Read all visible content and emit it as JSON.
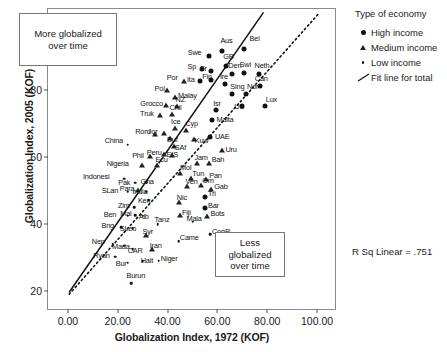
{
  "chart_data": {
    "type": "scatter",
    "title": "",
    "xlabel": "Globalization Index, 1972 (KOF)",
    "ylabel": "Globalization Index, 2005 (KOF)",
    "xlim": [
      -8,
      108
    ],
    "ylim": [
      14,
      104
    ],
    "xticks": [
      "0.00",
      "20.00",
      "40.00",
      "60.00",
      "80.00",
      "100.00"
    ],
    "xtick_values": [
      0,
      20,
      40,
      60,
      80,
      100
    ],
    "yticks": [
      "20",
      "40",
      "60",
      "80",
      "100"
    ],
    "ytick_values": [
      20,
      40,
      60,
      80,
      100
    ],
    "grid": false,
    "legend_position": "right",
    "r_squared_label": "R Sq Linear = .751",
    "annotations": [
      {
        "name": "more-globalized",
        "text": "More globalized over time"
      },
      {
        "name": "less-globalized",
        "text": "Less globalized over time"
      }
    ],
    "fit_line": {
      "label": "Fit line for total",
      "style": "solid",
      "x0": 0.5,
      "y0": 19.6,
      "x1": 78.5,
      "y1": 103.0
    },
    "reference_line": {
      "label": "y = x",
      "style": "dotted",
      "x0": 0.5,
      "y0": 19.0,
      "x1": 100.5,
      "y1": 102.5
    },
    "series": [
      {
        "name": "High income",
        "marker": "filled-circle",
        "key": "high"
      },
      {
        "name": "Medium income",
        "marker": "open-triangle",
        "key": "med"
      },
      {
        "name": "Low income",
        "marker": "small-dot",
        "key": "low"
      }
    ],
    "points": [
      {
        "label": "Bel",
        "x": 70.5,
        "y": 92.2,
        "type": "high",
        "lx": 6,
        "ly": -11
      },
      {
        "label": "Aus",
        "x": 62.0,
        "y": 91.5,
        "type": "high",
        "lx": -2,
        "ly": -11
      },
      {
        "label": "Swe",
        "x": 56.5,
        "y": 90.0,
        "type": "high",
        "lx": -21,
        "ly": -4
      },
      {
        "label": "GB",
        "x": 63.5,
        "y": 87.0,
        "type": "high",
        "lx": -3,
        "ly": -10
      },
      {
        "label": "Den",
        "x": 66.0,
        "y": 84.6,
        "type": "high",
        "lx": -4,
        "ly": -9
      },
      {
        "label": "Swi",
        "x": 70.5,
        "y": 84.8,
        "type": "high",
        "lx": -4,
        "ly": -9
      },
      {
        "label": "Neth",
        "x": 76.5,
        "y": 84.6,
        "type": "high",
        "lx": -4,
        "ly": -9
      },
      {
        "label": "Sp",
        "x": 54.0,
        "y": 86.0,
        "type": "high",
        "lx": -15,
        "ly": -3
      },
      {
        "label": "Fr",
        "x": 57.5,
        "y": 85.6,
        "type": "high",
        "lx": -11,
        "ly": -3
      },
      {
        "label": "Ita",
        "x": 53.0,
        "y": 82.4,
        "type": "high",
        "lx": -13,
        "ly": -2
      },
      {
        "label": "Fin",
        "x": 57.5,
        "y": 82.8,
        "type": "high",
        "lx": -9,
        "ly": -4
      },
      {
        "label": "Ire",
        "x": 63.0,
        "y": 81.6,
        "type": "high",
        "lx": -5,
        "ly": -8
      },
      {
        "label": "Can",
        "x": 77.0,
        "y": 81.2,
        "type": "high",
        "lx": -5,
        "ly": -8
      },
      {
        "label": "Por",
        "x": 46.5,
        "y": 82.6,
        "type": "med",
        "lx": -17,
        "ly": -4
      },
      {
        "label": "Pol",
        "x": 40.0,
        "y": 80.0,
        "type": "med",
        "lx": -13,
        "ly": -2
      },
      {
        "label": "Sing",
        "x": 66.0,
        "y": 78.6,
        "type": "high",
        "lx": -2,
        "ly": -8
      },
      {
        "label": "Nor",
        "x": 71.5,
        "y": 78.8,
        "type": "high",
        "lx": 1,
        "ly": -8
      },
      {
        "label": "Malay",
        "x": 43.0,
        "y": 77.8,
        "type": "med",
        "lx": 3,
        "ly": -2
      },
      {
        "label": "US",
        "x": 70.0,
        "y": 75.2,
        "type": "high",
        "lx": -8,
        "ly": 0
      },
      {
        "label": "Lux",
        "x": 79.0,
        "y": 75.0,
        "type": "high",
        "lx": 1,
        "ly": -7
      },
      {
        "label": "NZ",
        "x": 44.0,
        "y": 75.2,
        "type": "med",
        "lx": -2,
        "ly": -7
      },
      {
        "label": "Grocco",
        "x": 39.5,
        "y": 75.4,
        "type": "med",
        "lx": -26,
        "ly": -2
      },
      {
        "label": "Isr",
        "x": 59.5,
        "y": 74.0,
        "type": "high",
        "lx": -3,
        "ly": -7
      },
      {
        "label": "Chil",
        "x": 42.0,
        "y": 72.6,
        "type": "med",
        "lx": -3,
        "ly": -7
      },
      {
        "label": "Truk",
        "x": 37.0,
        "y": 72.4,
        "type": "med",
        "lx": -20,
        "ly": -2
      },
      {
        "label": "Malta",
        "x": 58.0,
        "y": 70.8,
        "type": "high",
        "lx": 4,
        "ly": -1
      },
      {
        "label": "Ice",
        "x": 43.0,
        "y": 68.4,
        "type": "med",
        "lx": -4,
        "ly": -7
      },
      {
        "label": "Cyp",
        "x": 47.5,
        "y": 67.8,
        "type": "med",
        "lx": -1,
        "ly": -7
      },
      {
        "label": "Jor",
        "x": 38.5,
        "y": 67.0,
        "type": "med",
        "lx": -16,
        "ly": -2
      },
      {
        "label": "Rom",
        "x": 35.0,
        "y": 66.6,
        "type": "med",
        "lx": -20,
        "ly": -3
      },
      {
        "label": "Buf",
        "x": 41.0,
        "y": 65.6,
        "type": "med",
        "lx": -3,
        "ly": 1
      },
      {
        "label": "UAE",
        "x": 57.0,
        "y": 66.0,
        "type": "high",
        "lx": 5,
        "ly": -1
      },
      {
        "label": "Kuw",
        "x": 50.5,
        "y": 65.2,
        "type": "med",
        "lx": 1,
        "ly": 1
      },
      {
        "label": "SAf",
        "x": 42.5,
        "y": 63.2,
        "type": "med",
        "lx": 1,
        "ly": 1
      },
      {
        "label": "China",
        "x": 24.0,
        "y": 63.6,
        "type": "low",
        "lx": -23,
        "ly": -5
      },
      {
        "label": "Uru",
        "x": 62.0,
        "y": 62.0,
        "type": "med",
        "lx": 3,
        "ly": -1
      },
      {
        "label": "EIS",
        "x": 42.0,
        "y": 60.6,
        "type": "med",
        "lx": -6,
        "ly": -1
      },
      {
        "label": "Peru",
        "x": 38.5,
        "y": 60.8,
        "type": "med",
        "lx": -17,
        "ly": -2
      },
      {
        "label": "Phil",
        "x": 33.0,
        "y": 60.2,
        "type": "med",
        "lx": -18,
        "ly": -1
      },
      {
        "label": "Jam",
        "x": 52.0,
        "y": 58.2,
        "type": "med",
        "lx": -3,
        "ly": -6
      },
      {
        "label": "Bah",
        "x": 56.5,
        "y": 58.2,
        "type": "med",
        "lx": 3,
        "ly": -4
      },
      {
        "label": "Ecu",
        "x": 36.0,
        "y": 57.4,
        "type": "med",
        "lx": -2,
        "ly": -6
      },
      {
        "label": "Nigeria",
        "x": 30.0,
        "y": 57.4,
        "type": "med",
        "lx": -36,
        "ly": -2
      },
      {
        "label": "Mol",
        "x": 45.0,
        "y": 55.2,
        "type": "med",
        "lx": 0,
        "ly": -6
      },
      {
        "label": "Tun",
        "x": 49.5,
        "y": 53.6,
        "type": "med",
        "lx": 1,
        "ly": -5
      },
      {
        "label": "Pan",
        "x": 55.5,
        "y": 53.4,
        "type": "med",
        "lx": 3,
        "ly": -4
      },
      {
        "label": "Indonesi",
        "x": 22.5,
        "y": 53.4,
        "type": "low",
        "lx": -41,
        "ly": -3
      },
      {
        "label": "Pak",
        "x": 27.0,
        "y": 52.2,
        "type": "low",
        "lx": -17,
        "ly": -1
      },
      {
        "label": "Gha",
        "x": 31.5,
        "y": 52.4,
        "type": "low",
        "lx": -6,
        "ly": -1
      },
      {
        "label": "Ven",
        "x": 48.0,
        "y": 51.4,
        "type": "med",
        "lx": -2,
        "ly": -5
      },
      {
        "label": "Om",
        "x": 53.5,
        "y": 51.6,
        "type": "med",
        "lx": 1,
        "ly": -5
      },
      {
        "label": "Gab",
        "x": 57.5,
        "y": 50.4,
        "type": "med",
        "lx": 3,
        "ly": -3
      },
      {
        "label": "India",
        "x": 31.5,
        "y": 49.6,
        "type": "low",
        "lx": -14,
        "ly": -1
      },
      {
        "label": "Para",
        "x": 28.0,
        "y": 50.0,
        "type": "med",
        "lx": -18,
        "ly": -2
      },
      {
        "label": "SLan",
        "x": 24.0,
        "y": 49.6,
        "type": "low",
        "lx": -26,
        "ly": -2
      },
      {
        "label": "Tri",
        "x": 55.0,
        "y": 48.0,
        "type": "high",
        "lx": 3,
        "ly": -4
      },
      {
        "label": "Ken",
        "x": 32.5,
        "y": 47.0,
        "type": "low",
        "lx": -11,
        "ly": 0
      },
      {
        "label": "Nic",
        "x": 44.5,
        "y": 46.6,
        "type": "med",
        "lx": -2,
        "ly": -5
      },
      {
        "label": "Bar",
        "x": 55.0,
        "y": 44.6,
        "type": "high",
        "lx": 3,
        "ly": -3
      },
      {
        "label": "Zim",
        "x": 26.5,
        "y": 45.0,
        "type": "low",
        "lx": -16,
        "ly": -2
      },
      {
        "label": "Alb",
        "x": 30.0,
        "y": 42.4,
        "type": "low",
        "lx": -4,
        "ly": 0
      },
      {
        "label": "Mal",
        "x": 27.0,
        "y": 42.6,
        "type": "low",
        "lx": -15,
        "ly": -2
      },
      {
        "label": "Ben",
        "x": 24.0,
        "y": 42.4,
        "type": "low",
        "lx": -24,
        "ly": -2
      },
      {
        "label": "Fiji",
        "x": 45.0,
        "y": 42.6,
        "type": "med",
        "lx": 2,
        "ly": -3
      },
      {
        "label": "Bots",
        "x": 56.0,
        "y": 42.2,
        "type": "med",
        "lx": 3,
        "ly": -3
      },
      {
        "label": "Mala",
        "x": 50.0,
        "y": 40.6,
        "type": "low",
        "lx": -6,
        "ly": -4
      },
      {
        "label": "Tanz",
        "x": 36.0,
        "y": 39.8,
        "type": "low",
        "lx": -3,
        "ly": -5
      },
      {
        "label": "Bng",
        "x": 21.5,
        "y": 39.0,
        "type": "low",
        "lx": -20,
        "ly": -2
      },
      {
        "label": "SLeo",
        "x": 26.0,
        "y": 38.6,
        "type": "low",
        "lx": -13,
        "ly": 0
      },
      {
        "label": "Syr",
        "x": 31.5,
        "y": 36.6,
        "type": "med",
        "lx": -4,
        "ly": -4
      },
      {
        "label": "ConR",
        "x": 57.0,
        "y": 36.8,
        "type": "low",
        "lx": 2,
        "ly": -3
      },
      {
        "label": "Came",
        "x": 44.5,
        "y": 34.8,
        "type": "low",
        "lx": 1,
        "ly": -4
      },
      {
        "label": "Nep",
        "x": 18.0,
        "y": 34.0,
        "type": "low",
        "lx": -21,
        "ly": -3
      },
      {
        "label": "Mada",
        "x": 22.5,
        "y": 33.4,
        "type": "low",
        "lx": -12,
        "ly": 0
      },
      {
        "label": "CAR",
        "x": 26.0,
        "y": 32.4,
        "type": "low",
        "lx": -5,
        "ly": 1
      },
      {
        "label": "Iran",
        "x": 34.0,
        "y": 32.6,
        "type": "med",
        "lx": -3,
        "ly": -4
      },
      {
        "label": "Ryan",
        "x": 19.0,
        "y": 30.2,
        "type": "low",
        "lx": -22,
        "ly": -2
      },
      {
        "label": "Bur",
        "x": 24.0,
        "y": 28.4,
        "type": "low",
        "lx": -12,
        "ly": 0
      },
      {
        "label": "Hait",
        "x": 30.0,
        "y": 28.8,
        "type": "low",
        "lx": -2,
        "ly": -1
      },
      {
        "label": "Niger",
        "x": 36.5,
        "y": 29.0,
        "type": "low",
        "lx": 2,
        "ly": -3
      },
      {
        "label": "Burun",
        "x": 25.5,
        "y": 22.2,
        "type": "low",
        "lx": -5,
        "ly": -8
      }
    ]
  },
  "legend": {
    "title": "Type of economy",
    "items": [
      {
        "key": "high",
        "label": "High income"
      },
      {
        "key": "med",
        "label": "Medium income"
      },
      {
        "key": "low",
        "label": "Low income"
      },
      {
        "key": "fit",
        "label": "Fit line for total"
      }
    ]
  }
}
